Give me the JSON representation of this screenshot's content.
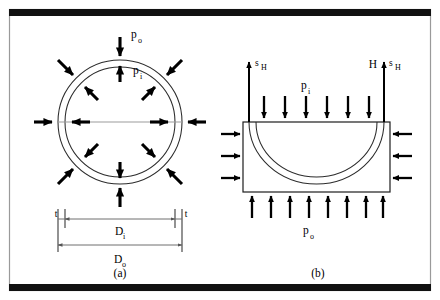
{
  "figure": {
    "background_color": "#ffffff",
    "frame": {
      "border_color": "#9a9a9a",
      "bar_color": "#111111"
    }
  },
  "panel_a": {
    "caption": "(a)",
    "description": "Full annular pipe cross-section with external pressure acting inward and internal pressure acting outward",
    "labels": {
      "external_pressure": "p",
      "external_pressure_sub": "o",
      "internal_pressure": "p",
      "internal_pressure_sub": "i"
    },
    "dimensions": [
      {
        "symbol": "t",
        "sub": "",
        "name": "wall-thickness-left"
      },
      {
        "symbol": "t",
        "sub": "",
        "name": "wall-thickness-right"
      },
      {
        "symbol": "D",
        "sub": "i",
        "name": "inner-diameter"
      },
      {
        "symbol": "D",
        "sub": "o",
        "name": "outer-diameter"
      }
    ],
    "geometry": {
      "center_x": 120,
      "center_y": 122,
      "outer_radius": 62,
      "inner_radius": 55,
      "inward_arrow_count": 8,
      "outward_arrow_count": 8
    }
  },
  "panel_b": {
    "caption": "(b)",
    "description": "Half-pipe free body diagram with hoop stress resultants, internal pressure on top and external pressure below",
    "labels": {
      "hoop_stress_left": "s",
      "hoop_stress_left_sub": "H",
      "hoop_stress_right": "s",
      "hoop_stress_right_sub": "H",
      "hoop_force": "H",
      "internal_pressure": "p",
      "internal_pressure_sub": "i",
      "external_pressure": "p",
      "external_pressure_sub": "o"
    },
    "geometry": {
      "box_left": 243,
      "box_right": 390,
      "box_top": 122,
      "box_bottom": 192,
      "top_arrow_count": 6,
      "bottom_arrow_count": 8,
      "side_arrow_count": 3
    }
  },
  "colors": {
    "line": "#2b2b2b",
    "arrow": "#000000",
    "dimension": "#6f6f6f",
    "frame": "#9a9a9a",
    "bar": "#111111"
  }
}
